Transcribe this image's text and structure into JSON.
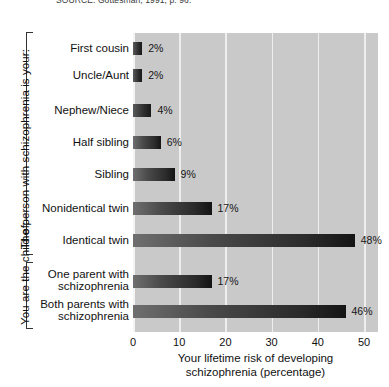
{
  "source_note": "SOURCE: Gottesman, 1991, p. 96.",
  "groups": [
    {
      "title": "The person with schizophrenia is your:"
    },
    {
      "title": "You are the child of:"
    }
  ],
  "x_axis": {
    "title": "Your lifetime risk of developing\nschizophrenia (percentage)",
    "ticks": [
      "0",
      "10",
      "20",
      "30",
      "40",
      "50"
    ]
  },
  "colors": {
    "plot_background": "#c9c9c9",
    "gridline": "#eeeeee",
    "bar_dark": "#141414",
    "bar_light": "#6f6f6f",
    "text": "#111111"
  },
  "chart_data": {
    "type": "bar",
    "orientation": "horizontal",
    "title": "",
    "xlabel": "Your lifetime risk of developing schizophrenia (percentage)",
    "ylabel": "",
    "xlim": [
      0,
      53
    ],
    "xticks": [
      0,
      10,
      20,
      30,
      40,
      50
    ],
    "grid": true,
    "legend": false,
    "categories": [
      "First cousin",
      "Uncle/Aunt",
      "Nephew/Niece",
      "Half sibling",
      "Sibling",
      "Nonidentical twin",
      "Identical twin",
      "One parent with\nschizophrenia",
      "Both parents with\nschizophrenia"
    ],
    "values": [
      2,
      2,
      4,
      6,
      9,
      17,
      48,
      17,
      46
    ],
    "value_labels": [
      "2%",
      "2%",
      "4%",
      "6%",
      "9%",
      "17%",
      "48%",
      "17%",
      "46%"
    ],
    "group_assignments": [
      0,
      0,
      0,
      0,
      0,
      0,
      0,
      1,
      1
    ]
  }
}
